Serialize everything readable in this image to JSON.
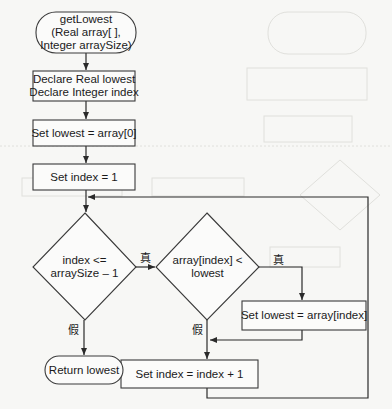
{
  "flowchart": {
    "title": "getLowest",
    "nodes": {
      "start": {
        "lines": [
          "getLowest",
          "(Real array[ ],",
          "Integer arraySize)"
        ]
      },
      "declare": {
        "lines": [
          "Declare Real lowest",
          "Declare Integer index"
        ]
      },
      "init_lowest": {
        "lines": [
          "Set lowest = array[0]"
        ]
      },
      "init_index": {
        "lines": [
          "Set index = 1"
        ]
      },
      "loop_condition": {
        "lines": [
          "index <=",
          "arraySize – 1"
        ]
      },
      "compare_condition": {
        "lines": [
          "array[index] <",
          "lowest"
        ]
      },
      "update_lowest": {
        "lines": [
          "Set lowest = array[index]"
        ]
      },
      "increment_index": {
        "lines": [
          "Set index = index + 1"
        ]
      },
      "return": {
        "lines": [
          "Return lowest"
        ]
      }
    },
    "branch_labels": {
      "true": "真",
      "false": "假"
    }
  },
  "colors": {
    "stroke": "#3a3a3a",
    "text": "#1a1a1a",
    "background": "#f7f7f5",
    "ghost": "#dcdcd8"
  }
}
